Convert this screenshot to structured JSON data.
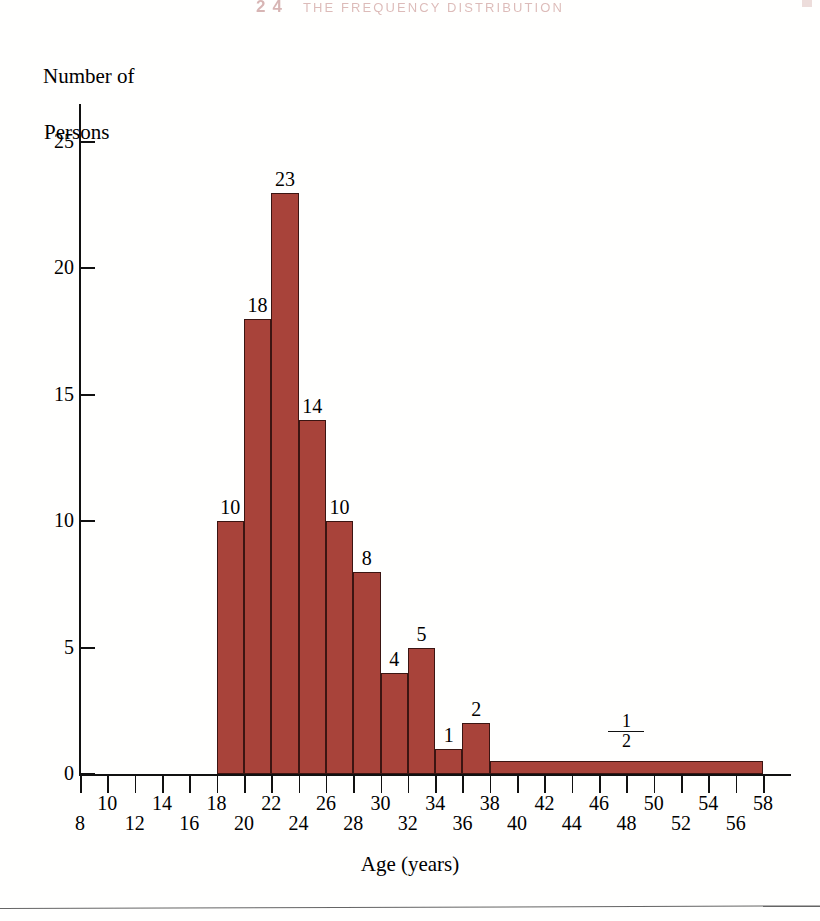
{
  "page": {
    "running_head": {
      "chapter_number": "24",
      "title": "THE FREQUENCY DISTRIBUTION",
      "color": "#9c3b36"
    }
  },
  "chart_data": {
    "type": "bar",
    "title": "",
    "xlabel": "Age (years)",
    "ylabel": "Number of\nPersons",
    "ylabel_line1": "Number of",
    "ylabel_line2": "Persons",
    "bar_color": "#a8433a",
    "bar_outline_color": "#3b1512",
    "grid": false,
    "legend": null,
    "xlim": [
      8,
      58
    ],
    "ylim": [
      0,
      26
    ],
    "bin_width": 2,
    "x_ticks": [
      8,
      10,
      12,
      14,
      16,
      18,
      20,
      22,
      24,
      26,
      28,
      30,
      32,
      34,
      36,
      38,
      40,
      42,
      44,
      46,
      48,
      50,
      52,
      54,
      56,
      58
    ],
    "x_tick_labels": [
      "8",
      "10",
      "12",
      "14",
      "16",
      "18",
      "20",
      "22",
      "24",
      "26",
      "28",
      "30",
      "32",
      "34",
      "36",
      "38",
      "40",
      "42",
      "44",
      "46",
      "48",
      "50",
      "52",
      "54",
      "56",
      "58"
    ],
    "y_ticks": [
      0,
      5,
      10,
      15,
      20,
      25
    ],
    "y_tick_labels": [
      "0",
      "5",
      "10",
      "15",
      "20",
      "25"
    ],
    "bins": [
      {
        "x0": 18,
        "x1": 20,
        "value": 10,
        "label": "10",
        "label_type": "number"
      },
      {
        "x0": 20,
        "x1": 22,
        "value": 18,
        "label": "18",
        "label_type": "number"
      },
      {
        "x0": 22,
        "x1": 24,
        "value": 23,
        "label": "23",
        "label_type": "number"
      },
      {
        "x0": 24,
        "x1": 26,
        "value": 14,
        "label": "14",
        "label_type": "number"
      },
      {
        "x0": 26,
        "x1": 28,
        "value": 10,
        "label": "10",
        "label_type": "number"
      },
      {
        "x0": 28,
        "x1": 30,
        "value": 8,
        "label": "8",
        "label_type": "number"
      },
      {
        "x0": 30,
        "x1": 32,
        "value": 4,
        "label": "4",
        "label_type": "number"
      },
      {
        "x0": 32,
        "x1": 34,
        "value": 5,
        "label": "5",
        "label_type": "number"
      },
      {
        "x0": 34,
        "x1": 36,
        "value": 1,
        "label": "1",
        "label_type": "number"
      },
      {
        "x0": 36,
        "x1": 38,
        "value": 2,
        "label": "2",
        "label_type": "number"
      },
      {
        "x0": 38,
        "x1": 58,
        "value": 0.5,
        "label": "1/2",
        "label_type": "fraction",
        "numerator": "1",
        "denominator": "2"
      }
    ],
    "categories": [
      "18-20",
      "20-22",
      "22-24",
      "24-26",
      "26-28",
      "28-30",
      "30-32",
      "32-34",
      "34-36",
      "36-38",
      "38-58"
    ],
    "values": [
      10,
      18,
      23,
      14,
      10,
      8,
      4,
      5,
      1,
      2,
      0.5
    ]
  }
}
